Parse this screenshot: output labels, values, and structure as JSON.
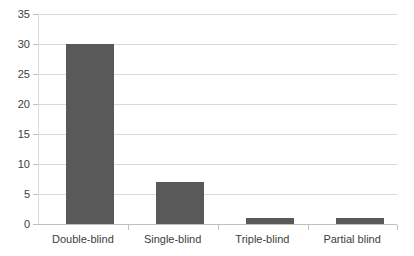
{
  "chart_data": {
    "type": "bar",
    "title": "",
    "subtitle": "",
    "xlabel": "",
    "ylabel": "",
    "categories": [
      "Double-blind",
      "Single-blind",
      "Triple-blind",
      "Partial blind"
    ],
    "values": [
      30,
      7,
      1,
      1
    ],
    "ylim": [
      0,
      35
    ],
    "ytick_step": 5,
    "yticks": [
      "0",
      "5",
      "10",
      "15",
      "20",
      "25",
      "30",
      "35"
    ],
    "grid": true,
    "legend": false,
    "legend_position": "none",
    "series": [
      {
        "name": "",
        "values": [
          30,
          7,
          1,
          1
        ]
      }
    ],
    "colors": {
      "bar": "#595959",
      "gridline": "#d9d9d9",
      "axis": "#bfbfbf",
      "text": "#404040",
      "background": "#ffffff"
    }
  }
}
